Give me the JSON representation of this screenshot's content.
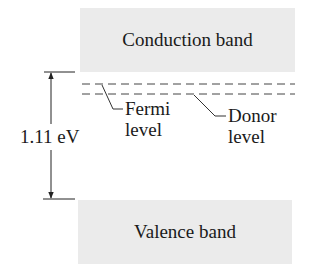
{
  "diagram": {
    "type": "energy-band-diagram",
    "bands": {
      "conduction": {
        "label": "Conduction band",
        "fill": "#ebebeb"
      },
      "valence": {
        "label": "Valence band",
        "fill": "#ebebeb"
      }
    },
    "gap": {
      "label": "1.11 eV"
    },
    "levels": {
      "fermi": {
        "label_line1": "Fermi",
        "label_line2": "level",
        "style": "dashed"
      },
      "donor": {
        "label_line1": "Donor",
        "label_line2": "level",
        "style": "dashed"
      }
    },
    "line_color": "#333333"
  }
}
